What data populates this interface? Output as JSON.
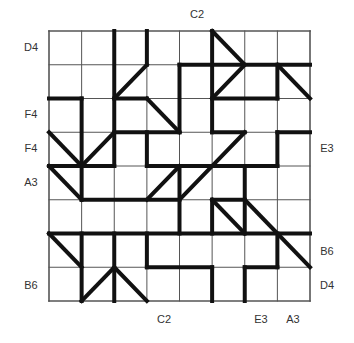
{
  "puzzle": {
    "grid": {
      "cols": 8,
      "rows": 8,
      "left": 49,
      "top": 31,
      "right": 310,
      "bottom": 301
    },
    "colors": {
      "thin_line": "#555555",
      "thick_line": "#111111",
      "background": "#ffffff",
      "label": "#333333"
    },
    "labels": {
      "top": [
        {
          "text": "C2",
          "x": 197,
          "y": 14
        }
      ],
      "left": [
        {
          "text": "D4",
          "x": 31,
          "y": 47
        },
        {
          "text": "F4",
          "x": 31,
          "y": 114
        },
        {
          "text": "F4",
          "x": 31,
          "y": 148
        },
        {
          "text": "A3",
          "x": 31,
          "y": 182
        },
        {
          "text": "B6",
          "x": 31,
          "y": 285
        }
      ],
      "right": [
        {
          "text": "E3",
          "x": 327,
          "y": 148
        },
        {
          "text": "B6",
          "x": 327,
          "y": 251
        },
        {
          "text": "D4",
          "x": 327,
          "y": 285
        }
      ],
      "bottom": [
        {
          "text": "C2",
          "x": 164,
          "y": 319
        },
        {
          "text": "E3",
          "x": 261,
          "y": 319
        },
        {
          "text": "A3",
          "x": 293,
          "y": 319
        }
      ]
    },
    "thick_segments": [
      [
        2,
        0,
        2,
        4
      ],
      [
        3,
        0,
        3,
        1
      ],
      [
        4,
        1,
        4,
        3
      ],
      [
        5,
        0,
        5,
        3
      ],
      [
        7,
        1,
        7,
        2
      ],
      [
        1,
        2,
        1,
        5
      ],
      [
        3,
        3,
        3,
        4
      ],
      [
        7,
        3,
        7,
        4
      ],
      [
        4,
        4,
        4,
        6
      ],
      [
        6,
        4,
        6,
        6
      ],
      [
        5,
        5,
        5,
        6
      ],
      [
        1,
        6,
        1,
        8
      ],
      [
        2,
        6,
        2,
        8
      ],
      [
        3,
        6,
        3,
        7
      ],
      [
        5,
        7,
        5,
        8
      ],
      [
        6,
        7,
        6,
        8
      ],
      [
        7,
        6,
        7,
        7
      ],
      [
        4,
        1,
        8,
        1
      ],
      [
        0,
        2,
        1,
        2
      ],
      [
        2,
        2,
        3,
        2
      ],
      [
        5,
        2,
        7,
        2
      ],
      [
        2,
        3,
        4,
        3
      ],
      [
        5,
        3,
        6,
        3
      ],
      [
        7,
        3,
        8,
        3
      ],
      [
        0,
        4,
        2,
        4
      ],
      [
        3,
        4,
        7,
        4
      ],
      [
        1,
        5,
        4,
        5
      ],
      [
        5,
        5,
        6,
        5
      ],
      [
        0,
        6,
        8,
        6
      ],
      [
        3,
        7,
        5,
        7
      ],
      [
        6,
        7,
        7,
        7
      ],
      [
        5,
        0,
        6,
        1
      ],
      [
        3,
        1,
        2,
        2
      ],
      [
        6,
        1,
        5,
        2
      ],
      [
        7,
        1,
        8,
        2
      ],
      [
        3,
        2,
        4,
        3
      ],
      [
        0,
        3,
        1,
        4
      ],
      [
        2,
        3,
        1,
        4
      ],
      [
        0,
        4,
        1,
        5
      ],
      [
        6,
        3,
        4,
        5
      ],
      [
        4,
        4,
        3,
        5
      ],
      [
        5,
        5,
        6,
        6
      ],
      [
        6,
        5,
        8,
        7
      ],
      [
        0,
        6,
        1,
        7
      ],
      [
        2,
        7,
        1,
        8
      ],
      [
        2,
        7,
        3,
        8
      ]
    ]
  }
}
